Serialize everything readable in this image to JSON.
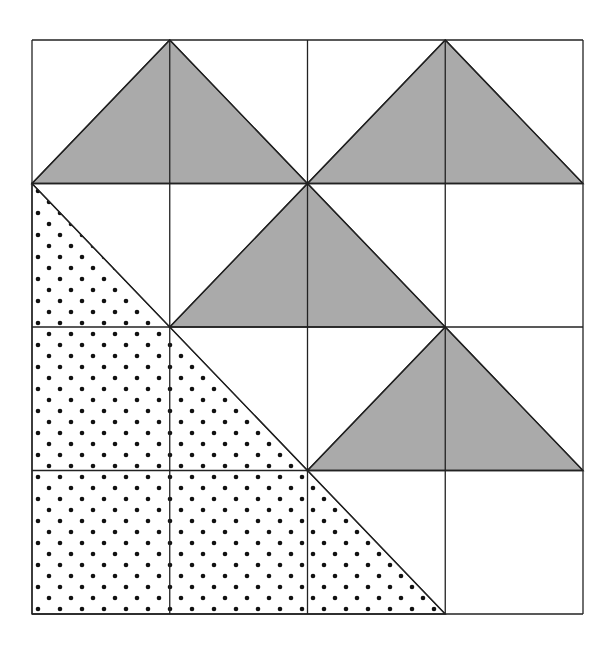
{
  "diagram": {
    "grid": {
      "cols": 4,
      "rows": 4,
      "x0": 32,
      "y0": 40,
      "x1": 583,
      "y1": 614
    },
    "colors": {
      "shaded": "#aaaaaa",
      "line": "#222222",
      "dot": "#111111",
      "background": "#ffffff"
    },
    "shaded_triangles": [
      {
        "apex": [
          1,
          0
        ],
        "base": [
          [
            0,
            1
          ],
          [
            2,
            1
          ]
        ]
      },
      {
        "apex": [
          3,
          0
        ],
        "base": [
          [
            2,
            1
          ],
          [
            4,
            1
          ]
        ]
      },
      {
        "apex": [
          2,
          1
        ],
        "base": [
          [
            1,
            2
          ],
          [
            3,
            2
          ]
        ]
      },
      {
        "apex": [
          3,
          2
        ],
        "base": [
          [
            2,
            3
          ],
          [
            4,
            3
          ]
        ]
      }
    ],
    "dotted_triangle": {
      "vertices": [
        [
          0,
          1
        ],
        [
          0,
          4
        ],
        [
          3,
          4
        ]
      ]
    }
  }
}
